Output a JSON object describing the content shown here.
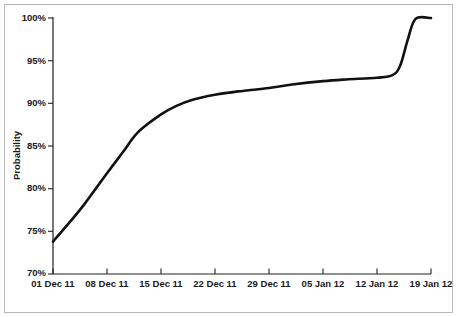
{
  "chart_data": {
    "type": "line",
    "title": "",
    "subtitle": "",
    "xlabel": "",
    "ylabel": "Probability",
    "grid": false,
    "legend": "none",
    "line_color": "#111111",
    "axis_color": "#222222",
    "background_color": "#ffffff",
    "frame_color": "#b9b9b9",
    "xlim": [
      "01 Dec 11",
      "19 Jan 12"
    ],
    "ylim": [
      70,
      100
    ],
    "ytick_labels": [
      "100%",
      "95%",
      "90%",
      "85%",
      "80%",
      "75%",
      "70%"
    ],
    "ytick_values": [
      100,
      95,
      90,
      85,
      80,
      75,
      70
    ],
    "xtick_labels": [
      "01 Dec 11",
      "08 Dec 11",
      "15 Dec 11",
      "22 Dec 11",
      "29 Dec 11",
      "05 Jan 12",
      "12 Jan 12",
      "19 Jan 12"
    ],
    "x": [
      "01 Dec 11",
      "03 Dec 11",
      "05 Dec 11",
      "08 Dec 11",
      "10 Dec 11",
      "12 Dec 11",
      "15 Dec 11",
      "17 Dec 11",
      "19 Dec 11",
      "22 Dec 11",
      "25 Dec 11",
      "29 Dec 11",
      "01 Jan 12",
      "05 Jan 12",
      "08 Jan 12",
      "12 Jan 12",
      "14 Jan 12",
      "15 Jan 12",
      "16 Jan 12",
      "17 Jan 12",
      "19 Jan 12"
    ],
    "values": [
      73.8,
      75.9,
      78.1,
      81.8,
      84.2,
      86.6,
      88.7,
      89.7,
      90.4,
      91.0,
      91.4,
      91.8,
      92.2,
      92.6,
      92.8,
      93.0,
      93.3,
      94.4,
      97.5,
      99.9,
      100.0
    ],
    "series": [
      {
        "name": "Probability",
        "values": [
          73.8,
          75.9,
          78.1,
          81.8,
          84.2,
          86.6,
          88.7,
          89.7,
          90.4,
          91.0,
          91.4,
          91.8,
          92.2,
          92.6,
          92.8,
          93.0,
          93.3,
          94.4,
          97.5,
          99.9,
          100.0
        ]
      }
    ],
    "annotations": []
  }
}
